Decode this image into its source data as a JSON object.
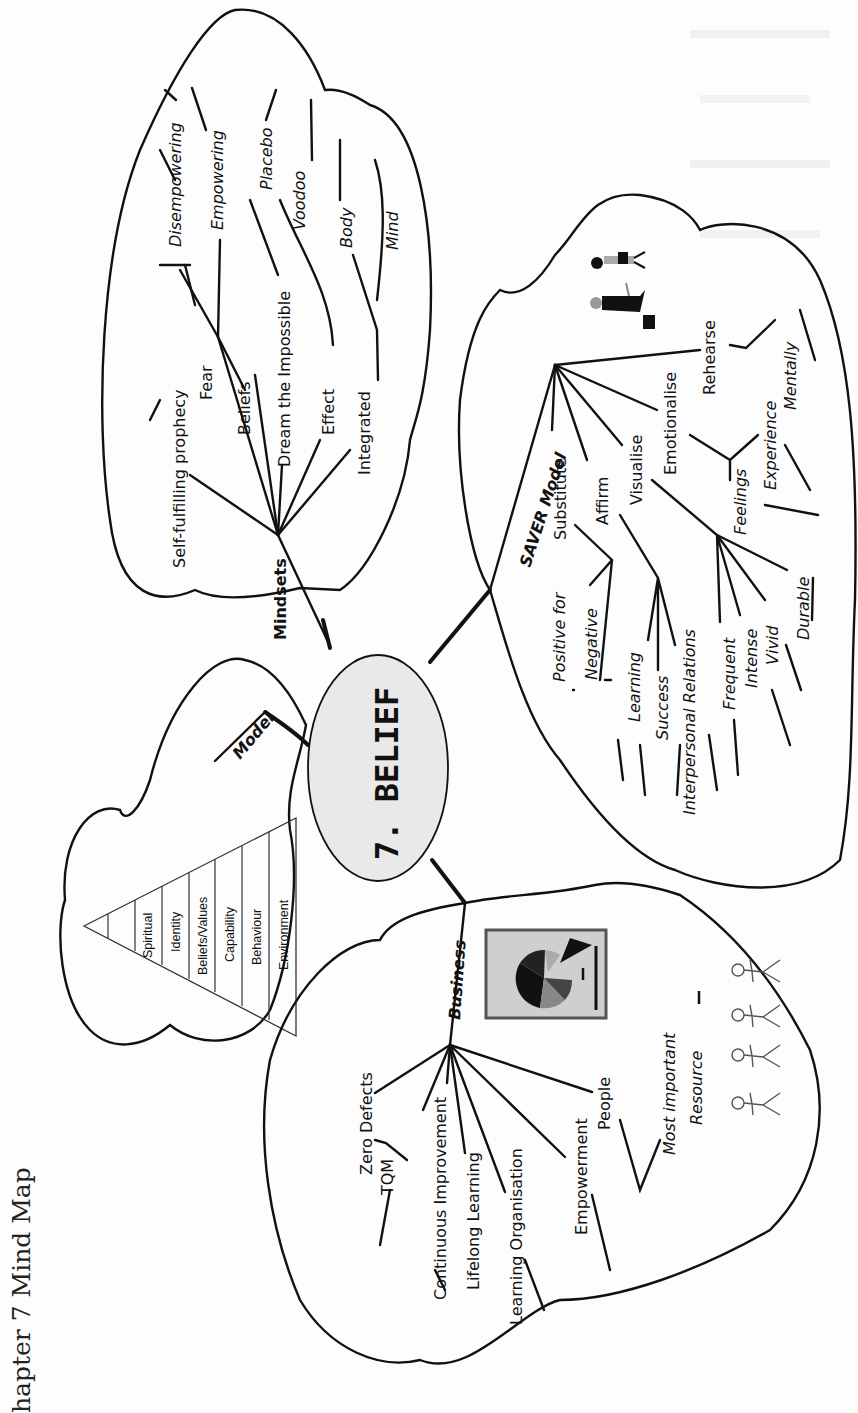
{
  "caption": "hapter 7 Mind Map",
  "center": {
    "label": "7. BELIEF",
    "fill": "#e9e9e9"
  },
  "branches": {
    "mindsets": {
      "label": "Mindsets",
      "items": [
        "Self-fulfilling prophecy",
        "Fear",
        "Beliefs",
        "Dream the Impossible",
        "Effect",
        "Integrated"
      ],
      "sub": {
        "beliefs": [
          "Disempowering",
          "Empowering"
        ],
        "effect": [
          "Placebo",
          "Voodoo"
        ],
        "integrated": [
          "Body",
          "Mind"
        ]
      }
    },
    "model": {
      "label": "Model",
      "pyramid": [
        "Spiritual",
        "Identity",
        "Beliefs/Values",
        "Capability",
        "Behaviour",
        "Environment"
      ]
    },
    "saver": {
      "label": "SAVER Model",
      "items": [
        "Substitute",
        "Affirm",
        "Visualise",
        "Emotionalise",
        "Rehearse"
      ],
      "sub": {
        "substitute": [
          "Positive for",
          "Negative"
        ],
        "affirm": [
          "Learning",
          "Success",
          "Interpersonal Relations"
        ],
        "visualise": [
          "Frequent",
          "Intense",
          "Vivid",
          "Durable"
        ],
        "emotionalise": [
          "Feelings",
          "Experience"
        ],
        "rehearse": [
          "Mentally"
        ]
      }
    },
    "business": {
      "label": "Business",
      "items": [
        "Zero Defects",
        "TQM",
        "Continuous Improvement",
        "Lifelong Learning",
        "Learning Organisation",
        "Empowerment",
        "People"
      ],
      "sub": {
        "people": [
          "Most important",
          "Resource"
        ]
      }
    }
  },
  "icons": {
    "pie_chart": "pie-chart-icon",
    "people_group": "people-group-icon",
    "business_people": "business-people-icon"
  }
}
